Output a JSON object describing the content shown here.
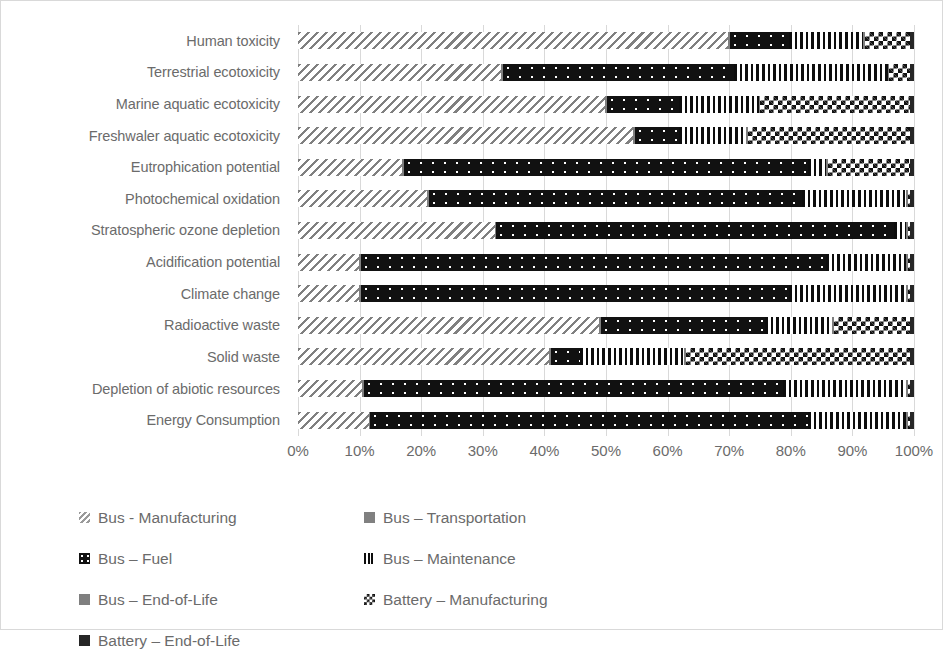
{
  "chart_data": {
    "type": "bar",
    "orientation": "horizontal",
    "stacked": true,
    "stack_mode": "percent",
    "title": "",
    "xlabel": "",
    "ylabel": "",
    "xlim": [
      0,
      100
    ],
    "xticks": [
      "0%",
      "10%",
      "20%",
      "30%",
      "40%",
      "50%",
      "60%",
      "70%",
      "80%",
      "90%",
      "100%"
    ],
    "grid": true,
    "legend_position": "bottom",
    "categories": [
      "Human toxicity",
      "Terrestrial ecotoxicity",
      "Marine aquatic ecotoxicity",
      "Freshwaler aquatic ecotoxicity",
      "Eutrophication potential",
      "Photochemical oxidation",
      "Stratospheric ozone depletion",
      "Acidification potential",
      "Climate change",
      "Radioactive waste",
      "Solid waste",
      "Depletion of abiotic resources",
      "Energy Consumption"
    ],
    "series": [
      {
        "name": "Bus - Manufacturing",
        "pattern": "diagonal-hatch",
        "values": [
          70.0,
          33.0,
          50.0,
          54.5,
          17.0,
          21.0,
          32.0,
          10.0,
          10.0,
          49.0,
          41.0,
          10.5,
          11.5
        ]
      },
      {
        "name": "Bus – Transportation",
        "pattern": "solid-grey",
        "values": [
          0.3,
          0.3,
          0.3,
          0.3,
          0.3,
          0.3,
          0.3,
          0.3,
          0.3,
          0.3,
          0.3,
          0.3,
          0.3
        ]
      },
      {
        "name": "Bus – Fuel",
        "pattern": "dark-dotted",
        "values": [
          9.7,
          37.7,
          11.7,
          7.2,
          65.7,
          60.7,
          64.7,
          75.7,
          69.7,
          26.7,
          4.7,
          68.2,
          71.2
        ]
      },
      {
        "name": "Bus – Maintenance",
        "pattern": "vertical-bars",
        "values": [
          12.0,
          25.0,
          13.0,
          11.0,
          3.0,
          17.0,
          2.0,
          13.0,
          19.0,
          11.0,
          17.0,
          20.0,
          16.0
        ]
      },
      {
        "name": "Bus – End-of-Life",
        "pattern": "solid-grey",
        "values": [
          0.3,
          0.3,
          0.3,
          0.3,
          0.3,
          0.3,
          0.3,
          0.3,
          0.3,
          0.3,
          0.3,
          0.3,
          0.3
        ]
      },
      {
        "name": "Battery – Manufacturing",
        "pattern": "checkerboard",
        "values": [
          7.4,
          3.4,
          24.4,
          26.4,
          13.4,
          0.4,
          0.4,
          0.4,
          0.4,
          12.4,
          36.7,
          0.4,
          0.4
        ]
      },
      {
        "name": "Battery – End-of-Life",
        "pattern": "solid-black",
        "values": [
          0.6,
          0.6,
          0.6,
          0.6,
          0.6,
          0.6,
          0.6,
          0.6,
          0.6,
          0.6,
          0.6,
          0.6,
          0.6
        ]
      }
    ]
  },
  "legend": {
    "items": [
      {
        "label": "Bus - Manufacturing",
        "swatch": "diagonal-hatch-swatch",
        "css": "p-mfg"
      },
      {
        "label": "Bus – Transportation",
        "swatch": "solid-grey-swatch",
        "css": "p-trans"
      },
      {
        "label": "Bus – Fuel",
        "swatch": "dark-dotted-swatch",
        "css": "p-fuel"
      },
      {
        "label": "Bus – Maintenance",
        "swatch": "vertical-bars-swatch",
        "css": "p-maint"
      },
      {
        "label": "Bus – End-of-Life",
        "swatch": "solid-grey-swatch",
        "css": "p-eol"
      },
      {
        "label": "Battery – Manufacturing",
        "swatch": "checkerboard-swatch",
        "css": "p-batmfg"
      },
      {
        "label": "Battery – End-of-Life",
        "swatch": "solid-black-swatch",
        "css": "p-bateol"
      }
    ]
  },
  "colors": {
    "axis_text": "#6b6b6b",
    "gridline": "#d9d9d9",
    "border": "#d9d9d9",
    "dark": "#111111",
    "grey": "#808080"
  }
}
